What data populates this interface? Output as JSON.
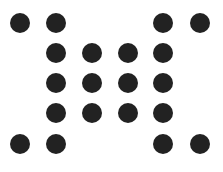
{
  "canvas": {
    "width": 223,
    "height": 172,
    "background": "#ffffff"
  },
  "dot_color": "#222222",
  "dot_radius": 10,
  "grid": {
    "columns_x": [
      20,
      56,
      92,
      128,
      163,
      200
    ],
    "rows_y": [
      23,
      53,
      83,
      113,
      144
    ]
  },
  "pattern": [
    [
      1,
      1,
      0,
      0,
      1,
      1
    ],
    [
      0,
      1,
      1,
      1,
      1,
      0
    ],
    [
      0,
      1,
      1,
      1,
      1,
      0
    ],
    [
      0,
      1,
      1,
      1,
      1,
      0
    ],
    [
      1,
      1,
      0,
      0,
      1,
      1
    ]
  ]
}
